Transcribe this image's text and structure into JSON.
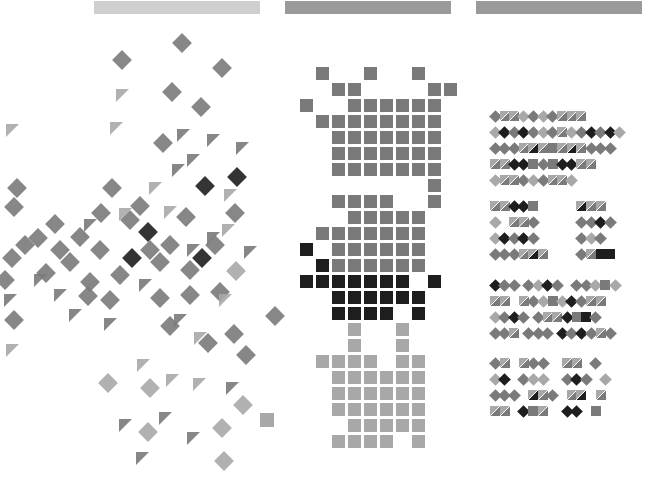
{
  "headers": [
    {
      "name": "panel-1-header",
      "x": 94,
      "w": 166,
      "color": "#cfcfcf"
    },
    {
      "name": "panel-2-header",
      "x": 285,
      "w": 166,
      "color": "#9a9a9a"
    },
    {
      "name": "panel-3-header",
      "x": 476,
      "w": 166,
      "color": "#9a9a9a"
    }
  ],
  "colors": {
    "light": "#a8a8a8",
    "mid": "#7a7a7a",
    "dark": "#1e1e1e",
    "bg": "#ffffff"
  },
  "scatter": {
    "diamonds": [
      [
        182,
        43,
        "mid"
      ],
      [
        122,
        60,
        "mid"
      ],
      [
        222,
        68,
        "mid"
      ],
      [
        172,
        92,
        "mid"
      ],
      [
        201,
        107,
        "mid"
      ],
      [
        163,
        143,
        "mid"
      ],
      [
        17,
        188,
        "mid"
      ],
      [
        14,
        207,
        "mid"
      ],
      [
        112,
        188,
        "mid"
      ],
      [
        140,
        206,
        "mid"
      ],
      [
        101,
        213,
        "mid"
      ],
      [
        130,
        220,
        "mid"
      ],
      [
        55,
        224,
        "mid"
      ],
      [
        38,
        238,
        "mid"
      ],
      [
        80,
        237,
        "mid"
      ],
      [
        186,
        217,
        "mid"
      ],
      [
        235,
        213,
        "mid"
      ],
      [
        205,
        186,
        "dark"
      ],
      [
        237,
        177,
        "dark"
      ],
      [
        148,
        232,
        "dark"
      ],
      [
        132,
        258,
        "dark"
      ],
      [
        202,
        258,
        "dark"
      ],
      [
        236,
        271,
        "light"
      ],
      [
        12,
        258,
        "mid"
      ],
      [
        5,
        280,
        "mid"
      ],
      [
        46,
        273,
        "mid"
      ],
      [
        70,
        262,
        "mid"
      ],
      [
        90,
        282,
        "mid"
      ],
      [
        120,
        275,
        "mid"
      ],
      [
        160,
        262,
        "mid"
      ],
      [
        190,
        270,
        "mid"
      ],
      [
        110,
        300,
        "mid"
      ],
      [
        160,
        298,
        "mid"
      ],
      [
        190,
        295,
        "mid"
      ],
      [
        220,
        292,
        "mid"
      ],
      [
        14,
        320,
        "mid"
      ],
      [
        88,
        296,
        "mid"
      ],
      [
        170,
        326,
        "mid"
      ],
      [
        208,
        343,
        "mid"
      ],
      [
        234,
        334,
        "mid"
      ],
      [
        246,
        355,
        "mid"
      ],
      [
        275,
        316,
        "mid"
      ],
      [
        108,
        383,
        "light"
      ],
      [
        150,
        388,
        "light"
      ],
      [
        243,
        405,
        "light"
      ],
      [
        222,
        428,
        "light"
      ],
      [
        148,
        432,
        "light"
      ],
      [
        224,
        461,
        "light"
      ],
      [
        60,
        250,
        "mid"
      ],
      [
        25,
        245,
        "mid"
      ],
      [
        100,
        250,
        "mid"
      ],
      [
        150,
        250,
        "mid"
      ],
      [
        170,
        245,
        "mid"
      ],
      [
        215,
        245,
        "mid"
      ]
    ],
    "triangles": [
      [
        122,
        95,
        "light"
      ],
      [
        12,
        130,
        "light"
      ],
      [
        116,
        128,
        "light"
      ],
      [
        183,
        135,
        "mid"
      ],
      [
        213,
        140,
        "mid"
      ],
      [
        242,
        148,
        "mid"
      ],
      [
        193,
        160,
        "mid"
      ],
      [
        178,
        170,
        "mid"
      ],
      [
        155,
        188,
        "light"
      ],
      [
        230,
        195,
        "light"
      ],
      [
        170,
        212,
        "light"
      ],
      [
        125,
        214,
        "light"
      ],
      [
        228,
        230,
        "light"
      ],
      [
        213,
        238,
        "mid"
      ],
      [
        193,
        250,
        "mid"
      ],
      [
        60,
        295,
        "mid"
      ],
      [
        75,
        315,
        "mid"
      ],
      [
        110,
        324,
        "mid"
      ],
      [
        180,
        320,
        "mid"
      ],
      [
        200,
        338,
        "light"
      ],
      [
        225,
        300,
        "light"
      ],
      [
        12,
        350,
        "light"
      ],
      [
        143,
        365,
        "light"
      ],
      [
        172,
        380,
        "light"
      ],
      [
        199,
        384,
        "light"
      ],
      [
        232,
        388,
        "mid"
      ],
      [
        125,
        425,
        "mid"
      ],
      [
        165,
        418,
        "mid"
      ],
      [
        193,
        438,
        "mid"
      ],
      [
        142,
        458,
        "mid"
      ],
      [
        10,
        300,
        "mid"
      ],
      [
        40,
        280,
        "mid"
      ],
      [
        145,
        285,
        "mid"
      ],
      [
        250,
        252,
        "mid"
      ],
      [
        90,
        225,
        "mid"
      ]
    ],
    "squares": [
      [
        267,
        420,
        "light"
      ]
    ]
  },
  "grid": {
    "origin_x": 300,
    "origin_y": 67,
    "cell": 16,
    "size": 13,
    "cells": [
      [
        1,
        0,
        "mid"
      ],
      [
        4,
        0,
        "mid"
      ],
      [
        7,
        0,
        "mid"
      ],
      [
        2,
        1,
        "mid"
      ],
      [
        3,
        1,
        "mid"
      ],
      [
        8,
        1,
        "mid"
      ],
      [
        9,
        1,
        "mid"
      ],
      [
        0,
        2,
        "mid"
      ],
      [
        3,
        2,
        "mid"
      ],
      [
        4,
        2,
        "mid"
      ],
      [
        5,
        2,
        "mid"
      ],
      [
        6,
        2,
        "mid"
      ],
      [
        7,
        2,
        "mid"
      ],
      [
        8,
        2,
        "mid"
      ],
      [
        1,
        3,
        "mid"
      ],
      [
        2,
        3,
        "mid"
      ],
      [
        3,
        3,
        "mid"
      ],
      [
        4,
        3,
        "mid"
      ],
      [
        5,
        3,
        "mid"
      ],
      [
        6,
        3,
        "mid"
      ],
      [
        7,
        3,
        "mid"
      ],
      [
        8,
        3,
        "mid"
      ],
      [
        2,
        4,
        "mid"
      ],
      [
        3,
        4,
        "mid"
      ],
      [
        4,
        4,
        "mid"
      ],
      [
        5,
        4,
        "mid"
      ],
      [
        6,
        4,
        "mid"
      ],
      [
        7,
        4,
        "mid"
      ],
      [
        8,
        4,
        "mid"
      ],
      [
        2,
        5,
        "mid"
      ],
      [
        3,
        5,
        "mid"
      ],
      [
        4,
        5,
        "mid"
      ],
      [
        5,
        5,
        "mid"
      ],
      [
        6,
        5,
        "mid"
      ],
      [
        7,
        5,
        "mid"
      ],
      [
        8,
        5,
        "mid"
      ],
      [
        2,
        6,
        "mid"
      ],
      [
        3,
        6,
        "mid"
      ],
      [
        4,
        6,
        "mid"
      ],
      [
        5,
        6,
        "mid"
      ],
      [
        6,
        6,
        "mid"
      ],
      [
        7,
        6,
        "mid"
      ],
      [
        8,
        6,
        "mid"
      ],
      [
        8,
        7,
        "mid"
      ],
      [
        2,
        8,
        "mid"
      ],
      [
        4,
        8,
        "mid"
      ],
      [
        8,
        8,
        "mid"
      ],
      [
        3,
        8,
        "mid"
      ],
      [
        5,
        8,
        "mid"
      ],
      [
        3,
        9,
        "mid"
      ],
      [
        4,
        9,
        "mid"
      ],
      [
        5,
        9,
        "mid"
      ],
      [
        6,
        9,
        "mid"
      ],
      [
        7,
        9,
        "mid"
      ],
      [
        1,
        10,
        "mid"
      ],
      [
        2,
        10,
        "mid"
      ],
      [
        3,
        10,
        "mid"
      ],
      [
        4,
        10,
        "mid"
      ],
      [
        5,
        10,
        "mid"
      ],
      [
        6,
        10,
        "mid"
      ],
      [
        7,
        10,
        "mid"
      ],
      [
        0,
        11,
        "dark"
      ],
      [
        2,
        11,
        "mid"
      ],
      [
        3,
        11,
        "mid"
      ],
      [
        4,
        11,
        "mid"
      ],
      [
        5,
        11,
        "mid"
      ],
      [
        6,
        11,
        "mid"
      ],
      [
        7,
        11,
        "mid"
      ],
      [
        1,
        12,
        "dark"
      ],
      [
        2,
        12,
        "mid"
      ],
      [
        3,
        12,
        "mid"
      ],
      [
        4,
        12,
        "mid"
      ],
      [
        5,
        12,
        "mid"
      ],
      [
        6,
        12,
        "mid"
      ],
      [
        7,
        12,
        "mid"
      ],
      [
        0,
        13,
        "dark"
      ],
      [
        1,
        13,
        "dark"
      ],
      [
        2,
        13,
        "dark"
      ],
      [
        3,
        13,
        "dark"
      ],
      [
        4,
        13,
        "dark"
      ],
      [
        5,
        13,
        "dark"
      ],
      [
        6,
        13,
        "dark"
      ],
      [
        8,
        13,
        "dark"
      ],
      [
        2,
        14,
        "dark"
      ],
      [
        3,
        14,
        "dark"
      ],
      [
        4,
        14,
        "dark"
      ],
      [
        5,
        14,
        "dark"
      ],
      [
        6,
        14,
        "dark"
      ],
      [
        7,
        14,
        "dark"
      ],
      [
        2,
        15,
        "dark"
      ],
      [
        3,
        15,
        "dark"
      ],
      [
        4,
        15,
        "dark"
      ],
      [
        5,
        15,
        "dark"
      ],
      [
        7,
        15,
        "dark"
      ],
      [
        3,
        16,
        "light"
      ],
      [
        6,
        16,
        "light"
      ],
      [
        3,
        17,
        "light"
      ],
      [
        6,
        17,
        "light"
      ],
      [
        1,
        18,
        "light"
      ],
      [
        2,
        18,
        "light"
      ],
      [
        3,
        18,
        "light"
      ],
      [
        4,
        18,
        "light"
      ],
      [
        6,
        18,
        "light"
      ],
      [
        7,
        18,
        "light"
      ],
      [
        2,
        19,
        "light"
      ],
      [
        3,
        19,
        "light"
      ],
      [
        4,
        19,
        "light"
      ],
      [
        5,
        19,
        "light"
      ],
      [
        6,
        19,
        "light"
      ],
      [
        7,
        19,
        "light"
      ],
      [
        2,
        20,
        "light"
      ],
      [
        3,
        20,
        "light"
      ],
      [
        4,
        20,
        "light"
      ],
      [
        5,
        20,
        "light"
      ],
      [
        6,
        20,
        "light"
      ],
      [
        7,
        20,
        "light"
      ],
      [
        2,
        21,
        "light"
      ],
      [
        3,
        21,
        "light"
      ],
      [
        4,
        21,
        "light"
      ],
      [
        5,
        21,
        "light"
      ],
      [
        6,
        21,
        "light"
      ],
      [
        7,
        21,
        "light"
      ],
      [
        3,
        22,
        "light"
      ],
      [
        4,
        22,
        "light"
      ],
      [
        5,
        22,
        "light"
      ],
      [
        6,
        22,
        "light"
      ],
      [
        7,
        22,
        "light"
      ],
      [
        2,
        23,
        "light"
      ],
      [
        3,
        23,
        "light"
      ],
      [
        4,
        23,
        "light"
      ],
      [
        5,
        23,
        "light"
      ],
      [
        7,
        23,
        "light"
      ]
    ]
  },
  "groups": {
    "cell": 9.6,
    "rows": [
      {
        "y": 111,
        "x": 490,
        "pattern": "DmxxxxDlDmDlDmxxxxxDl"
      },
      {
        "y": 127,
        "x": 490,
        "pattern": "DlDdDmDdDmDlDmxxDlDmDdDmDdDl"
      },
      {
        "y": 143,
        "x": 490,
        "pattern": "DmDmDmxxxdxxsmxxxdxxDmDmDm"
      },
      {
        "y": 159,
        "x": 490,
        "pattern": "xxxxDdDdsmDmsmDdDdxxxx"
      },
      {
        "y": 175,
        "x": 490,
        "pattern": "DlxxxxDmDlDmxxxxDl"
      },
      {
        "y": 201,
        "x": 490,
        "pattern": "xxxxDdDdsm        xdxxxx"
      },
      {
        "y": 217,
        "x": 490,
        "pattern": "Dl  xxxxDm        DmDmDdDm"
      },
      {
        "y": 233,
        "x": 490,
        "pattern": "DlDdDmDdDm        DmDlDm"
      },
      {
        "y": 249,
        "x": 490,
        "pattern": "DmDmDmxxxdxx      Dmxxsdsd"
      },
      {
        "y": 280,
        "x": 490,
        "pattern": "DdDmDm DmDlDdDm  DmDmDlsmDl"
      },
      {
        "y": 296,
        "x": 490,
        "pattern": "xxxx  xxDmDlsmDlDdDmxxxx"
      },
      {
        "y": 312,
        "x": 490,
        "pattern": "DlDmDdDm DmxxxxDdsmsdDm"
      },
      {
        "y": 328,
        "x": 490,
        "pattern": "DmDmxx DmDmDm DdDmDdDmxxDm"
      },
      {
        "y": 358,
        "x": 490,
        "pattern": "Dmxx  xxDmDm   xxxx  Dm"
      },
      {
        "y": 374,
        "x": 490,
        "pattern": "DlDd  DmDlDl   DmDdDm  Dl"
      },
      {
        "y": 390,
        "x": 490,
        "pattern": "DmDmDm  xdxxDm  xxxd  xx"
      },
      {
        "y": 406,
        "x": 490,
        "pattern": "xxxx  Ddsmxx   DdDd  sm"
      }
    ]
  }
}
